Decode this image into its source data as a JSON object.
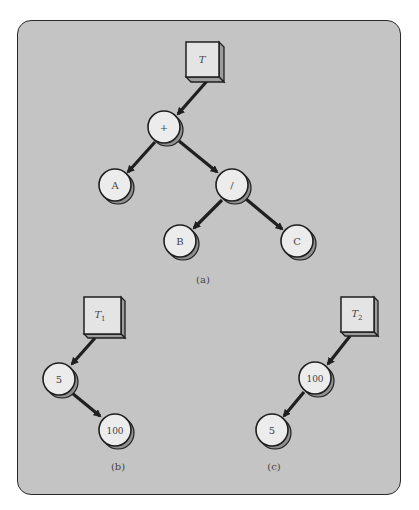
{
  "figure": {
    "panel_color": "#c4c4c4",
    "node_fill": "#ececec",
    "node_shadow": "#8f8f8f",
    "edge_color": "#1f1f1f",
    "subfigures": [
      {
        "id": "a",
        "caption": "(a)",
        "root_pointer": "T",
        "root_pointer_subscript": "",
        "nodes": [
          {
            "id": "plus",
            "label": "+"
          },
          {
            "id": "A",
            "label": "A"
          },
          {
            "id": "div",
            "label": "/"
          },
          {
            "id": "B",
            "label": "B"
          },
          {
            "id": "C",
            "label": "C"
          }
        ],
        "edges": [
          [
            "T",
            "plus"
          ],
          [
            "plus",
            "A"
          ],
          [
            "plus",
            "div"
          ],
          [
            "div",
            "B"
          ],
          [
            "div",
            "C"
          ]
        ]
      },
      {
        "id": "b",
        "caption": "(b)",
        "root_pointer": "T",
        "root_pointer_subscript": "1",
        "nodes": [
          {
            "id": "n5",
            "label": "5"
          },
          {
            "id": "n100",
            "label": "100"
          }
        ],
        "edges": [
          [
            "T1",
            "n5"
          ],
          [
            "n5",
            "n100"
          ]
        ]
      },
      {
        "id": "c",
        "caption": "(c)",
        "root_pointer": "T",
        "root_pointer_subscript": "2",
        "nodes": [
          {
            "id": "n100",
            "label": "100"
          },
          {
            "id": "n5",
            "label": "5"
          }
        ],
        "edges": [
          [
            "T2",
            "n100"
          ],
          [
            "n100",
            "n5"
          ]
        ]
      }
    ]
  }
}
